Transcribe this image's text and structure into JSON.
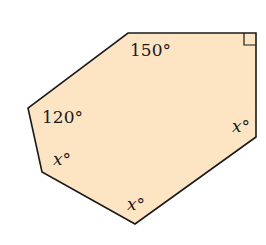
{
  "figure": {
    "shape": "hexagon",
    "fill_color": "#fde5c4",
    "stroke_color": "#1a1a1a",
    "vertices": [
      [
        128,
        33
      ],
      [
        256,
        33
      ],
      [
        256,
        137
      ],
      [
        135,
        224
      ],
      [
        42,
        172
      ],
      [
        28,
        108
      ]
    ],
    "right_angle_marker": "top-right"
  },
  "labels": {
    "angle_top": "150°",
    "angle_left": "120°",
    "angle_lower_left": "x°",
    "angle_bottom": "x°",
    "angle_right": "x°"
  }
}
